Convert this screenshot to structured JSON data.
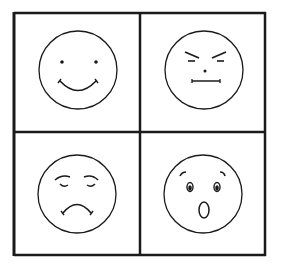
{
  "figure": {
    "stroke_color": "#1a1a1a",
    "background_color": "#ffffff",
    "grid": {
      "rows": 2,
      "cols": 2
    },
    "faces": [
      {
        "position": "top-left",
        "emotion": "happy",
        "features": "dot eyes, upward smile"
      },
      {
        "position": "top-right",
        "emotion": "angry",
        "features": "slanted brows, narrowed eyes, dot nose, flat line mouth"
      },
      {
        "position": "bottom-left",
        "emotion": "sad",
        "features": "arched brows, closed downcast eyes, frown"
      },
      {
        "position": "bottom-right",
        "emotion": "surprised",
        "features": "raised brows, wide eyes, open oval mouth"
      }
    ]
  }
}
